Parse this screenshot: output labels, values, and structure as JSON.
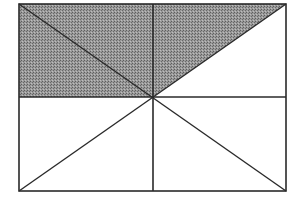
{
  "diagram": {
    "rect": {
      "x1": 19,
      "y1": 4,
      "x2": 286,
      "y2": 191
    },
    "center": {
      "x": 153,
      "y": 97
    },
    "shaded_region": "top half except the upper-right triangle below the diagonal from center to top-right corner",
    "colors": {
      "stroke": "#2a2a2a",
      "shade": "#8a8a8a",
      "background": "#ffffff"
    },
    "shaded_fraction_label": ""
  }
}
